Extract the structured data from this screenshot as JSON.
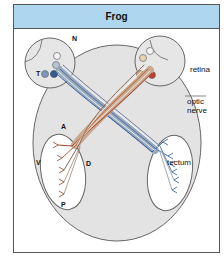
{
  "header": {
    "title": "Frog"
  },
  "labels": {
    "retina": "retina",
    "optic_nerve_line1": "optic",
    "optic_nerve_line2": "nerve",
    "tectum": "tectum"
  },
  "axes": {
    "nasal": "N",
    "temporal": "T",
    "anterior": "A",
    "ventral": "V",
    "dorsal": "D",
    "posterior": "P"
  },
  "colors": {
    "header_bg": "#aed6ee",
    "head_fill": "#e3e3e3",
    "left_eye_fibers": "#4a6fa5",
    "right_eye_fibers": "#a0442c",
    "outline": "#555555"
  }
}
